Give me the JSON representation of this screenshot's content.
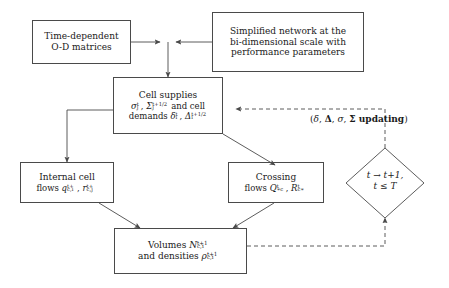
{
  "diagram": {
    "stroke_color": "#4a4a4a",
    "text_color": "#1a1a1a",
    "background": "#ffffff",
    "nodes": {
      "od_matrices": {
        "shape": "rectangle",
        "line1": "Time-dependent",
        "line2": "O-D matrices"
      },
      "network": {
        "shape": "rectangle",
        "line1": "Simplified network at the",
        "line2": "bi-dimensional scale with",
        "line3": "performance parameters"
      },
      "cell_supplies": {
        "shape": "rectangle",
        "line1": "Cell supplies",
        "line2_prefix": "",
        "line2_suffix": "and cell",
        "line3_prefix": "demands",
        "sigma": "σ",
        "Sigma": "Σ",
        "delta": "δ",
        "Delta": "Δ",
        "sub_j": "j",
        "sub_i": "i",
        "sup_t": "t",
        "sup_t_half": "t+1/2"
      },
      "internal_flows": {
        "shape": "rectangle",
        "line1": "Internal cell",
        "line2_prefix": "flows",
        "q": "q",
        "r": "r",
        "q_sub": "c,i",
        "r_sub": "c,j",
        "sup": "t+",
        "comma": ","
      },
      "crossing_flows": {
        "shape": "rectangle",
        "line1": "Crossing",
        "line2_prefix": "flows",
        "Q": "Q",
        "R": "R",
        "Q_sub": "∗c",
        "R_sub": "c∗",
        "sup": "t",
        "comma": ","
      },
      "volumes": {
        "shape": "rectangle",
        "line1_prefix": "Volumes",
        "N": "N",
        "N_sub": "c,i",
        "N_sup": "t+1",
        "line2_prefix": "and densities",
        "rho": "ρ",
        "rho_sub": "c,i",
        "rho_sup": "t+1"
      },
      "time_step": {
        "shape": "diamond",
        "line1": "t → t+1,",
        "line2": "t ≤ T"
      }
    },
    "labels": {
      "updating": {
        "open": "(",
        "delta": "δ",
        "sep1": ", ",
        "Delta_bold": "Δ",
        "sep2": ", ",
        "sigma": "σ",
        "sep3": ", ",
        "Sigma_bold": "Σ",
        "text": " updating",
        "close": ")"
      }
    },
    "edges": [
      {
        "from": "od_matrices",
        "to": "junction",
        "style": "solid",
        "arrow": true
      },
      {
        "from": "network",
        "to": "junction",
        "style": "solid",
        "arrow": true
      },
      {
        "from": "junction",
        "to": "cell_supplies",
        "style": "solid",
        "arrow": true
      },
      {
        "from": "cell_supplies",
        "to": "internal_flows",
        "style": "solid",
        "arrow": true
      },
      {
        "from": "cell_supplies",
        "to": "crossing_flows",
        "style": "solid",
        "arrow": true
      },
      {
        "from": "internal_flows",
        "to": "volumes",
        "style": "solid",
        "arrow": true
      },
      {
        "from": "crossing_flows",
        "to": "volumes",
        "style": "solid",
        "arrow": true
      },
      {
        "from": "volumes",
        "to": "time_step",
        "style": "dashed",
        "arrow": true
      },
      {
        "from": "time_step",
        "to": "cell_supplies",
        "style": "dashed",
        "arrow": true
      }
    ]
  }
}
